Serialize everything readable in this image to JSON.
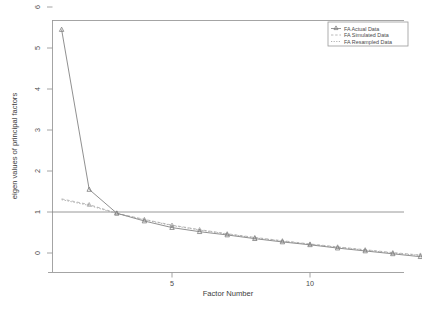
{
  "chart_data": {
    "type": "line",
    "title": "",
    "xlabel": "Factor Number",
    "ylabel": "eigen values of principal factors",
    "xlim": [
      1,
      14
    ],
    "ylim": [
      -0.35,
      6.2
    ],
    "xticks": [
      5,
      10
    ],
    "xtick_labels": [
      "5",
      "10"
    ],
    "yticks": [
      0,
      1,
      2,
      3,
      4,
      5,
      6
    ],
    "ytick_labels": [
      "0",
      "1",
      "2",
      "3",
      "4",
      "5",
      "6"
    ],
    "grid": false,
    "reference_line": {
      "y": 1,
      "orientation": "horizontal"
    },
    "legend_position": "top-right",
    "x": [
      1,
      2,
      3,
      4,
      5,
      6,
      7,
      8,
      9,
      10,
      11,
      12,
      13,
      14
    ],
    "series": [
      {
        "name": "FA Actual Data",
        "marker": "triangle",
        "linestyle": "solid",
        "values": [
          5.45,
          1.55,
          0.97,
          0.78,
          0.62,
          0.52,
          0.44,
          0.35,
          0.27,
          0.2,
          0.12,
          0.05,
          -0.02,
          -0.09
        ]
      },
      {
        "name": "FA Simulated Data",
        "marker": "triangle",
        "linestyle": "dashed",
        "values": [
          1.32,
          1.18,
          0.97,
          0.82,
          0.68,
          0.57,
          0.47,
          0.38,
          0.3,
          0.22,
          0.15,
          0.08,
          0.01,
          -0.05
        ]
      },
      {
        "name": "FA Resampled Data",
        "marker": "none",
        "linestyle": "dotted",
        "values": [
          1.3,
          1.16,
          0.96,
          0.81,
          0.67,
          0.56,
          0.46,
          0.37,
          0.29,
          0.21,
          0.14,
          0.07,
          0.0,
          -0.06
        ]
      }
    ]
  },
  "legend": {
    "entries": [
      {
        "label": "FA Actual Data"
      },
      {
        "label": "FA Simulated Data"
      },
      {
        "label": "FA Resampled Data"
      }
    ]
  },
  "colors": {
    "axis": "#9a9a9a",
    "actual": "#8a8a8a",
    "simulated": "#a8a8a8",
    "resampled": "#9e9e9e",
    "reference": "#8c8c8c",
    "background": "#ffffff"
  }
}
